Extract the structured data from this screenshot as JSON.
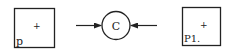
{
  "diagram": {
    "left_box": {
      "label": "p",
      "marker": "+"
    },
    "center_node": {
      "label": "C"
    },
    "right_box": {
      "label": "P1.",
      "marker": "+"
    },
    "arrows": [
      {
        "from": "left_box",
        "to": "center_node"
      },
      {
        "from": "right_box",
        "to": "center_node"
      }
    ],
    "colors": {
      "stroke": "#222222",
      "background": "#ffffff"
    }
  }
}
